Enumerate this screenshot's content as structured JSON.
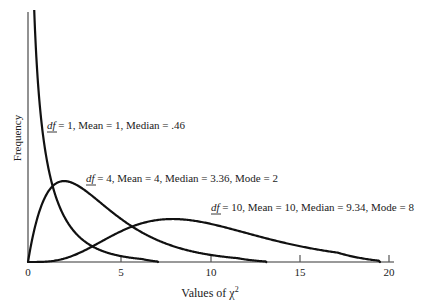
{
  "chart_data": {
    "type": "line",
    "title": "",
    "xlabel": "Values of χ²",
    "ylabel": "Frequency",
    "xlim": [
      0,
      20
    ],
    "ylim": [
      0,
      0.55
    ],
    "grid": false,
    "legend": "none (inline annotations)",
    "x_ticks": [
      0,
      5,
      10,
      15,
      20
    ],
    "x_tick_labels": [
      "0",
      "5",
      "10",
      "15",
      "20"
    ],
    "y_ticks": [],
    "series": [
      {
        "name": "df = 1",
        "df": 1,
        "distribution": "chi-square",
        "mean": 1,
        "median": 0.46,
        "mode": null,
        "x": [
          0.05,
          0.1,
          0.25,
          0.5,
          1,
          2,
          3,
          4,
          5,
          6,
          7
        ],
        "values": [
          0.88,
          0.6,
          0.35,
          0.22,
          0.24,
          0.1,
          0.05,
          0.03,
          0.01,
          0.01,
          0.0
        ],
        "annotation": "df = 1, Mean = 1, Median = .46"
      },
      {
        "name": "df = 4",
        "df": 4,
        "distribution": "chi-square",
        "mean": 4,
        "median": 3.36,
        "mode": 2,
        "x": [
          0,
          1,
          2,
          3,
          4,
          5,
          6,
          8,
          10,
          12,
          13
        ],
        "values": [
          0.0,
          0.15,
          0.18,
          0.17,
          0.14,
          0.1,
          0.07,
          0.04,
          0.02,
          0.01,
          0.0
        ],
        "annotation": "df = 4, Mean = 4, Median = 3.36, Mode = 2"
      },
      {
        "name": "df = 10",
        "df": 10,
        "distribution": "chi-square",
        "mean": 10,
        "median": 9.34,
        "mode": 8,
        "x": [
          0,
          2,
          4,
          6,
          8,
          10,
          12,
          14,
          16,
          18,
          19.5
        ],
        "values": [
          0.0,
          0.01,
          0.03,
          0.08,
          0.1,
          0.09,
          0.07,
          0.05,
          0.03,
          0.01,
          0.0
        ],
        "annotation": "df = 10, Mean = 10, Median = 9.34, Mode = 8"
      }
    ]
  },
  "labels": {
    "ylabel": "Frequency",
    "xlabel_prefix": "Values of χ",
    "xlabel_sup": "2",
    "ticks": [
      "0",
      "5",
      "10",
      "15",
      "20"
    ],
    "annotations": [
      {
        "df_text": "df",
        "rest": " = 1, Mean = 1, Median = .46"
      },
      {
        "df_text": "df",
        "rest": " = 4, Mean = 4, Median = 3.36, Mode = 2"
      },
      {
        "df_text": "df",
        "rest": " = 10, Mean = 10, Median = 9.34, Mode = 8"
      }
    ]
  },
  "style": {
    "curve_color": "#111111",
    "axis_color": "#777777",
    "background": "#ffffff"
  }
}
